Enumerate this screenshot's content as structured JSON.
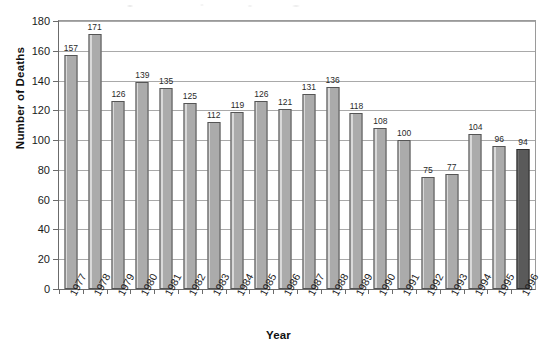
{
  "chart_data": {
    "type": "bar",
    "title": "",
    "xlabel": "Year",
    "ylabel": "Number of Deaths",
    "categories": [
      "1977",
      "1978",
      "1979",
      "1980",
      "1981",
      "1982",
      "1983",
      "1984",
      "1985",
      "1986",
      "1987",
      "1988",
      "1989",
      "1990",
      "1991",
      "1992",
      "1993",
      "1994",
      "1995",
      "1996"
    ],
    "values": [
      157,
      171,
      126,
      139,
      135,
      125,
      112,
      119,
      126,
      121,
      131,
      136,
      118,
      108,
      100,
      75,
      77,
      104,
      96,
      94
    ],
    "ylim": [
      0,
      180
    ],
    "yticks": [
      0,
      20,
      40,
      60,
      80,
      100,
      120,
      140,
      160,
      180
    ],
    "grid": "horizontal",
    "legend": "none",
    "bar_color": "#ababab",
    "bar_border_color": "#555555",
    "highlight_color": "#5a5a5a",
    "highlight_border_color": "#2e2e2e",
    "highlighted_categories": [
      "1996"
    ],
    "gridline_color": "#a9a9a9",
    "axis_color": "#6b6b6b",
    "show_value_labels": true
  }
}
